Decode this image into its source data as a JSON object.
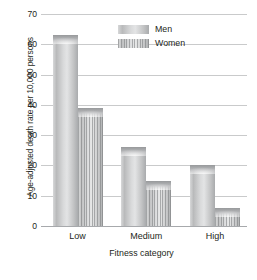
{
  "chart_data": {
    "type": "bar",
    "title": "",
    "categories": [
      "Low",
      "Medium",
      "High"
    ],
    "series": [
      {
        "name": "Men",
        "values": [
          63,
          26,
          20
        ]
      },
      {
        "name": "Women",
        "values": [
          39,
          15,
          6
        ]
      }
    ],
    "xlabel": "Fitness category",
    "ylabel": "Age-adjusted death rate per 10,000 persons",
    "ylim": [
      0,
      70
    ],
    "yticks": [
      0,
      10,
      20,
      30,
      40,
      50,
      60,
      70
    ],
    "ytick_labels": [
      "0",
      "10",
      "20",
      "30",
      "40",
      "50",
      "60",
      "70"
    ],
    "grid": true,
    "legend_position": "top-right",
    "colors": {
      "men": "#c9cacb",
      "women": "#c9cacb",
      "gridline": "#c9cacb",
      "text": "#231f20",
      "background": "#ffffff"
    }
  }
}
